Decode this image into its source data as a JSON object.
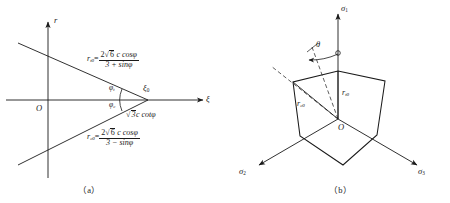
{
  "figure": {
    "panel_a": {
      "caption": "（a）",
      "axes": {
        "vertical": "r",
        "horizontal": "ξ"
      },
      "origin": "O",
      "apex_label": {
        "base": "ξ",
        "sub": "0"
      },
      "apex_distance": {
        "radical": "√",
        "radicand": "3",
        "rest": "c cotφ"
      },
      "angle_upper": {
        "base": "φ",
        "sub": "t"
      },
      "angle_lower": {
        "base": "φ",
        "sub": "c"
      },
      "eq_upper": {
        "lhs_base": "r",
        "lhs_sub": "t0",
        "eq": "=",
        "num_pre": "2",
        "num_radical": "√",
        "num_radicand": "6",
        "num_post": " c cosφ",
        "den": "3 + sinφ"
      },
      "eq_lower": {
        "lhs_base": "r",
        "lhs_sub": "c0",
        "eq": "=",
        "num_pre": "2",
        "num_radical": "√",
        "num_radicand": "6",
        "num_post": " c cosφ",
        "den": "3 − sinφ"
      }
    },
    "panel_b": {
      "caption": "（b）",
      "origin": "O",
      "axis_sigma1": {
        "base": "σ",
        "sub": "1"
      },
      "axis_sigma2": {
        "base": "σ",
        "sub": "2"
      },
      "axis_sigma3": {
        "base": "σ",
        "sub": "3"
      },
      "angle_theta": "θ",
      "radius_tension": {
        "base": "r",
        "sub": "t0"
      },
      "radius_compression": {
        "base": "r",
        "sub": "c0"
      }
    }
  },
  "style": {
    "ink": "#1a1a1a",
    "background": "#ffffff"
  }
}
